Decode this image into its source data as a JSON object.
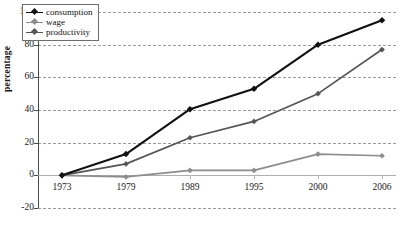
{
  "chart_data": {
    "type": "line",
    "title": "",
    "xlabel": "",
    "ylabel": "percentage",
    "categories": [
      "1973",
      "1979",
      "1989",
      "1995",
      "2000",
      "2006"
    ],
    "ylim": [
      -20,
      100
    ],
    "yticks": [
      100,
      80,
      60,
      40,
      20,
      0,
      -20
    ],
    "grid": true,
    "legend_position": "upper-left-inside",
    "series": [
      {
        "name": "consumption",
        "color": "#111111",
        "values": [
          0,
          13,
          40.5,
          53,
          80,
          95
        ]
      },
      {
        "name": "wage",
        "color": "#8d8d8d",
        "values": [
          0,
          -1,
          3,
          3,
          13,
          12
        ]
      },
      {
        "name": "productivity",
        "color": "#555555",
        "values": [
          0,
          7,
          23,
          33,
          50,
          77
        ]
      }
    ]
  },
  "legend": {
    "items": [
      {
        "label": "consumption"
      },
      {
        "label": "wage"
      },
      {
        "label": "productivity"
      }
    ]
  },
  "axes": {
    "y_title": "percentage",
    "y_tick_labels": [
      "100",
      "80",
      "60",
      "40",
      "20",
      "0",
      "-20"
    ],
    "x_tick_labels": [
      "1973",
      "1979",
      "1989",
      "1995",
      "2000",
      "2006"
    ]
  }
}
